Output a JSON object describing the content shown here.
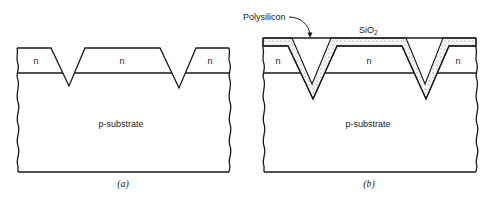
{
  "figure": {
    "panels": [
      {
        "id": "a",
        "caption": "(a)",
        "regions": {
          "n_left": "n",
          "n_middle": "n",
          "n_right": "n",
          "substrate": "p-substrate"
        }
      },
      {
        "id": "b",
        "caption": "(b)",
        "regions": {
          "n_left": "n",
          "n_middle": "n",
          "n_right": "n",
          "substrate": "p-substrate"
        },
        "annotations": {
          "polysilicon": "Polysilicon",
          "oxide_main": "SiO",
          "oxide_sub": "2"
        }
      }
    ]
  }
}
